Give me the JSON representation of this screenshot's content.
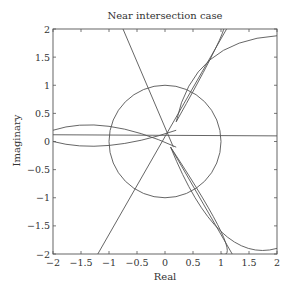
{
  "chart_data": {
    "type": "line",
    "title": "Near intersection case",
    "xlabel": "Real",
    "ylabel": "Imaginary",
    "xlim": [
      -2,
      2
    ],
    "ylim": [
      -2,
      2
    ],
    "grid": false,
    "legend": null,
    "x_ticks": [
      "-2",
      "-1.5",
      "-1",
      "-0.5",
      "0",
      "0.5",
      "1",
      "1.5",
      "2"
    ],
    "y_ticks": [
      "2",
      "1.5",
      "1",
      "0.5",
      "0",
      "-0.5",
      "-1",
      "-1.5",
      "-2"
    ],
    "series": [
      {
        "name": "unit circle",
        "shape": "circle",
        "center": [
          0,
          0
        ],
        "radius": 1
      },
      {
        "name": "horizontal line",
        "x": [
          -2,
          2
        ],
        "y": [
          0.12,
          0.1
        ]
      },
      {
        "name": "steep line down-right",
        "x": [
          -0.75,
          0.15
        ],
        "y": [
          2,
          -0.1
        ]
      },
      {
        "name": "line lower-left to upper-right",
        "x": [
          -1.2,
          1.1
        ],
        "y": [
          -2,
          2
        ]
      },
      {
        "name": "line to lower right",
        "x": [
          0.1,
          1.2
        ],
        "y": [
          -0.1,
          -2
        ]
      },
      {
        "name": "upper arc",
        "x": [
          0.2,
          0.8,
          2
        ],
        "y": [
          0.35,
          1.45,
          1.88
        ]
      },
      {
        "name": "lower arc",
        "x": [
          0.1,
          1.0,
          2
        ],
        "y": [
          -0.1,
          -1.6,
          -1.9
        ]
      },
      {
        "name": "upper lens arcs",
        "x": [
          0.2,
          0.8,
          1.05
        ],
        "y": [
          0.35,
          1.45,
          2
        ]
      },
      {
        "name": "lower lens arcs",
        "x": [
          0.1,
          1.0,
          1.0
        ],
        "y": [
          -0.1,
          -1.6,
          -2
        ]
      },
      {
        "name": "left lens upper",
        "x": [
          -2,
          -1,
          0.2
        ],
        "y": [
          0.2,
          0.27,
          -0.1
        ]
      },
      {
        "name": "left lens lower",
        "x": [
          -2,
          -1,
          0.2
        ],
        "y": [
          0.0,
          -0.07,
          0.2
        ]
      }
    ]
  }
}
